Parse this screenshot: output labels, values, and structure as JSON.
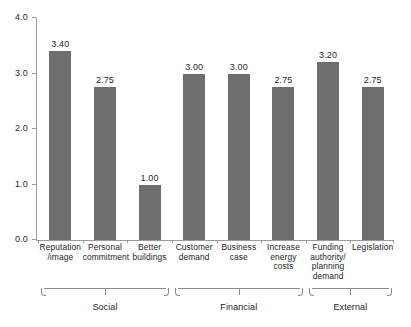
{
  "chart_data": {
    "type": "bar",
    "title": "",
    "subtitle": "",
    "xlabel": "",
    "ylabel": "",
    "ylim": [
      0.0,
      4.0
    ],
    "ytick_labels": [
      "0.0",
      "1.0",
      "2.0",
      "3.0",
      "4.0"
    ],
    "ytick_values": [
      0.0,
      1.0,
      2.0,
      3.0,
      4.0
    ],
    "grid": false,
    "legend": "none",
    "bar_color": "#6e6e6e",
    "axis_color": "#9a9a9a",
    "categories": [
      "Reputation\n/image",
      "Personal\ncommitment",
      "Better\nbuildings",
      "Customer\ndemand",
      "Business\ncase",
      "Increase\nenergy\ncosts",
      "Funding\nauthority/\nplanning\ndemand",
      "Legislation"
    ],
    "values": [
      3.4,
      2.75,
      1.0,
      3.0,
      3.0,
      2.75,
      3.2,
      2.75
    ],
    "data_labels": [
      "3.40",
      "2.75",
      "1.00",
      "3.00",
      "3.00",
      "2.75",
      "3.20",
      "2.75"
    ],
    "bars": [
      {
        "label_lines": [
          "Reputation",
          "/image"
        ],
        "value": 3.4,
        "data_label": "3.40"
      },
      {
        "label_lines": [
          "Personal",
          "commitment"
        ],
        "value": 2.75,
        "data_label": "2.75"
      },
      {
        "label_lines": [
          "Better",
          "buildings"
        ],
        "value": 1.0,
        "data_label": "1.00"
      },
      {
        "label_lines": [
          "Customer",
          "demand"
        ],
        "value": 3.0,
        "data_label": "3.00"
      },
      {
        "label_lines": [
          "Business",
          "case"
        ],
        "value": 3.0,
        "data_label": "3.00"
      },
      {
        "label_lines": [
          "Increase",
          "energy",
          "costs"
        ],
        "value": 2.75,
        "data_label": "2.75"
      },
      {
        "label_lines": [
          "Funding",
          "authority/",
          "planning",
          "demand"
        ],
        "value": 3.2,
        "data_label": "3.20"
      },
      {
        "label_lines": [
          "Legislation"
        ],
        "value": 2.75,
        "data_label": "2.75"
      }
    ],
    "groups": [
      {
        "label": "Social",
        "bar_indices": [
          0,
          1,
          2
        ]
      },
      {
        "label": "Financial",
        "bar_indices": [
          3,
          4,
          5
        ]
      },
      {
        "label": "External",
        "bar_indices": [
          6,
          7
        ]
      }
    ]
  }
}
